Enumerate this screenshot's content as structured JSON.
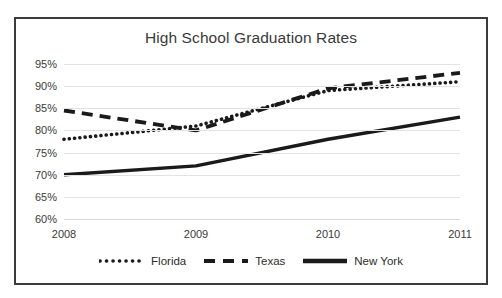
{
  "chart_data": {
    "type": "line",
    "title": "High School Graduation Rates",
    "xlabel": "",
    "ylabel": "",
    "x": [
      "2008",
      "2009",
      "2010",
      "2011"
    ],
    "categories": [
      "2008",
      "2009",
      "2010",
      "2011"
    ],
    "ylim": [
      60,
      95
    ],
    "ytick_labels": [
      "95%",
      "90%",
      "85%",
      "80%",
      "75%",
      "70%",
      "65%",
      "60%"
    ],
    "ytick_values": [
      95,
      90,
      85,
      80,
      75,
      70,
      65,
      60
    ],
    "grid": true,
    "legend_position": "bottom",
    "series": [
      {
        "name": "Florida",
        "style": "dotted",
        "color": "#1a1a1a",
        "values": [
          78,
          81,
          89,
          91
        ]
      },
      {
        "name": "Texas",
        "style": "dashed",
        "color": "#1a1a1a",
        "values": [
          84.5,
          80,
          89.5,
          93
        ]
      },
      {
        "name": "New York",
        "style": "solid",
        "color": "#1a1a1a",
        "values": [
          70,
          72,
          78,
          83
        ]
      }
    ]
  },
  "legend": {
    "items": [
      {
        "label": "Florida",
        "swatch": "dotted-line-swatch"
      },
      {
        "label": "Texas",
        "swatch": "dashed-line-swatch"
      },
      {
        "label": "New York",
        "swatch": "solid-line-swatch"
      }
    ]
  }
}
